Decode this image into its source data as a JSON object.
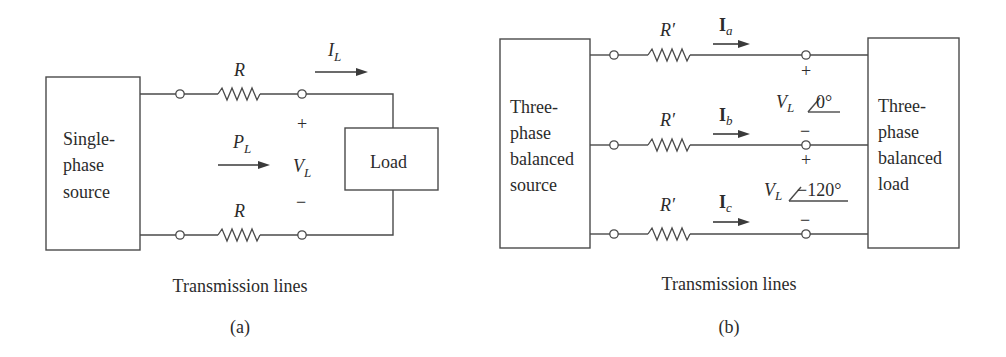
{
  "panel_a": {
    "source_box": {
      "lines": [
        "Single-",
        "phase",
        "source"
      ]
    },
    "load_box": {
      "label": "Load"
    },
    "resistor_top": {
      "label": "R"
    },
    "resistor_bottom": {
      "label": "R"
    },
    "current": {
      "symbol": "I",
      "subscript": "L"
    },
    "power": {
      "symbol": "P",
      "subscript": "L"
    },
    "voltage": {
      "plus": "+",
      "symbol": "V",
      "subscript": "L",
      "minus": "−"
    },
    "caption": "Transmission lines",
    "panel_label": "(a)"
  },
  "panel_b": {
    "source_box": {
      "lines": [
        "Three-",
        "phase",
        "balanced",
        "source"
      ]
    },
    "load_box": {
      "lines": [
        "Three-",
        "phase",
        "balanced",
        "load"
      ]
    },
    "lines": [
      {
        "resistor_label": "R′",
        "current_symbol": "I",
        "current_subscript": "a"
      },
      {
        "resistor_label": "R′",
        "current_symbol": "I",
        "current_subscript": "b"
      },
      {
        "resistor_label": "R′",
        "current_symbol": "I",
        "current_subscript": "c"
      }
    ],
    "voltages": [
      {
        "plus": "+",
        "symbol": "V",
        "subscript": "L",
        "angle": "0°",
        "minus": "−"
      },
      {
        "plus": "+",
        "symbol": "V",
        "subscript": "L",
        "angle": "−120°",
        "minus": "−"
      }
    ],
    "caption": "Transmission lines",
    "panel_label": "(b)"
  }
}
